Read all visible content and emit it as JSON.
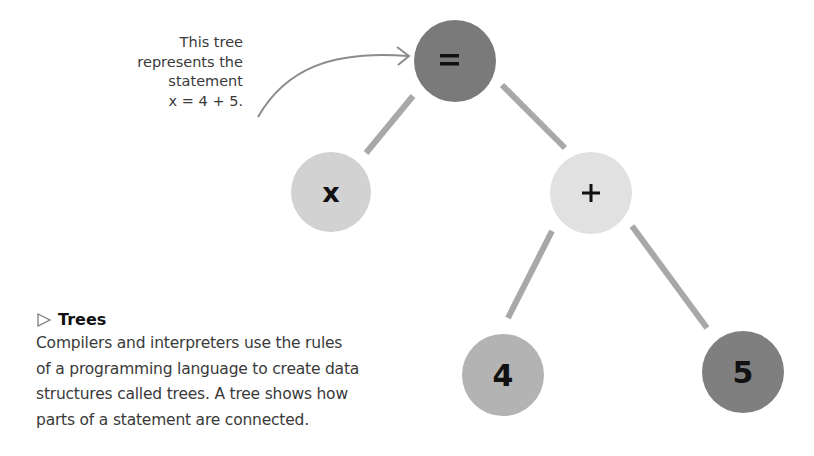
{
  "annotation": {
    "lines": [
      "This tree",
      "represents the",
      "statement",
      "x = 4 + 5."
    ]
  },
  "caption": {
    "title": "Trees",
    "title_icon": "triangle-right-outline-icon",
    "lines": [
      "Compilers and interpreters use the rules",
      "of a programming language to create data",
      "structures called trees. A tree shows how",
      "parts of a statement are connected."
    ]
  },
  "tree": {
    "nodes": [
      {
        "id": "equals",
        "label": "=",
        "cx": 455,
        "cy": 61,
        "r": 41,
        "fill": "#7a7a7a"
      },
      {
        "id": "x",
        "label": "x",
        "cx": 331,
        "cy": 192,
        "r": 40,
        "fill": "#d2d2d2"
      },
      {
        "id": "plus",
        "label": "+",
        "cx": 591,
        "cy": 193,
        "r": 41,
        "fill": "#e1e1e1"
      },
      {
        "id": "four",
        "label": "4",
        "cx": 503,
        "cy": 375,
        "r": 41,
        "fill": "#b3b3b3"
      },
      {
        "id": "five",
        "label": "5",
        "cx": 743,
        "cy": 372,
        "r": 41,
        "fill": "#7f7f7f"
      }
    ],
    "edges": [
      {
        "from": "equals",
        "to": "x"
      },
      {
        "from": "equals",
        "to": "plus"
      },
      {
        "from": "plus",
        "to": "four"
      },
      {
        "from": "plus",
        "to": "five"
      }
    ],
    "edge_color": "#a8a8a8",
    "arrow_color": "#8c8c8c"
  }
}
